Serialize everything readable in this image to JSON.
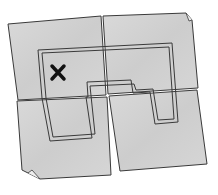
{
  "illustration": {
    "subject": "torn map in four pieces",
    "mark": "X",
    "colors": {
      "background": "#ffffff",
      "paper": "#d4d4d4",
      "paper_light": "#e2e2e2",
      "outline": "#3a3a3a",
      "mark": "#111111"
    },
    "pieces": [
      "top-left",
      "top-right",
      "bottom-left",
      "bottom-right"
    ]
  }
}
